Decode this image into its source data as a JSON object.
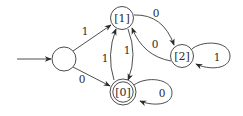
{
  "diagram": {
    "type": "finite-automaton",
    "colors": {
      "stroke": "#3a3a3a",
      "text": "#2a2a2a",
      "background": "#ffffff"
    },
    "states": [
      {
        "id": "start",
        "label": "",
        "initial": true,
        "accepting": false
      },
      {
        "id": "s1",
        "label": "[1]",
        "initial": false,
        "accepting": false
      },
      {
        "id": "s0",
        "label": "[0]",
        "initial": false,
        "accepting": true
      },
      {
        "id": "s2",
        "label": "[2]",
        "initial": false,
        "accepting": false
      }
    ],
    "transitions": [
      {
        "from": "start",
        "to": "s1",
        "label": "1"
      },
      {
        "from": "start",
        "to": "s0",
        "label": "0"
      },
      {
        "from": "s1",
        "to": "s2",
        "label": "0"
      },
      {
        "from": "s2",
        "to": "s1",
        "label": "0"
      },
      {
        "from": "s1",
        "to": "s0",
        "label": "1"
      },
      {
        "from": "s0",
        "to": "s1",
        "label": "1"
      },
      {
        "from": "s2",
        "to": "s2",
        "label": "1"
      },
      {
        "from": "s0",
        "to": "s0",
        "label": "0"
      }
    ]
  }
}
